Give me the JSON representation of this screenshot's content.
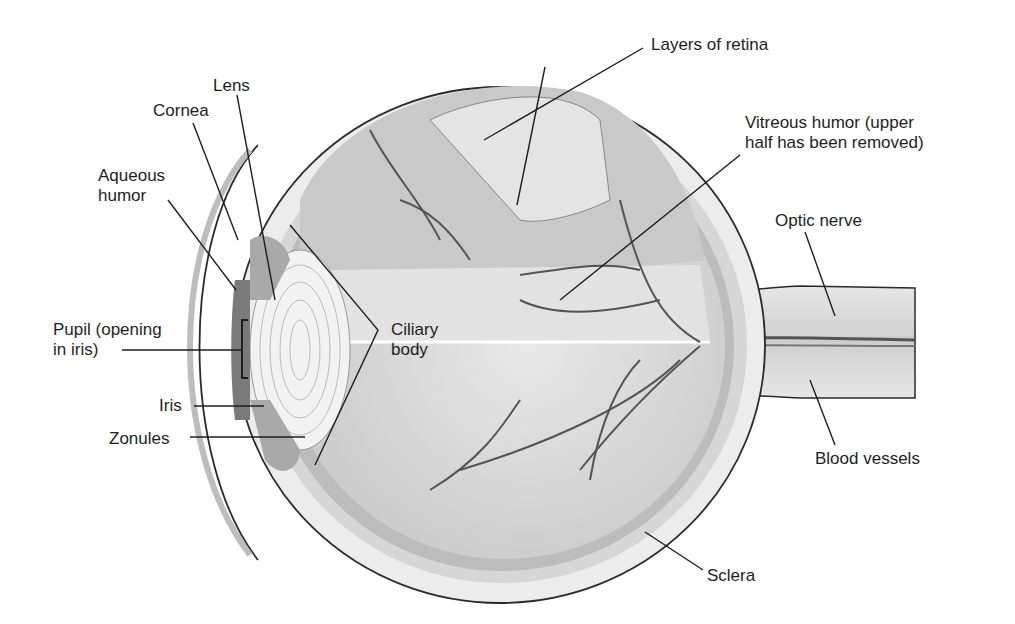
{
  "figure": {
    "colors": {
      "background": "#ffffff",
      "outline": "#2a2a2a",
      "sclera": "#e4e4e4",
      "choroid": "#b8b8b8",
      "vitreous": "#d9d9d9",
      "vessel": "#555555",
      "text": "#1e1e1e"
    }
  },
  "labels": {
    "lens": "Lens",
    "cornea": "Cornea",
    "aqueous_humor": "Aqueous\nhumor",
    "pupil": "Pupil (opening\nin iris)",
    "iris": "Iris",
    "zonules": "Zonules",
    "ciliary_body": "Ciliary\nbody",
    "layers_of_retina": "Layers of retina",
    "vitreous_humor": "Vitreous humor (upper\nhalf has been removed)",
    "optic_nerve": "Optic nerve",
    "blood_vessels": "Blood vessels",
    "sclera": "Sclera"
  }
}
